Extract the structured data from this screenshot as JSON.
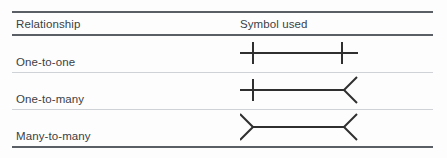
{
  "table": {
    "headers": {
      "relationship": "Relationship",
      "symbol": "Symbol used"
    },
    "rows": [
      {
        "label": "One-to-one",
        "symbol_name": "one-to-one-symbol",
        "left_end": "single-tick",
        "right_end": "single-tick"
      },
      {
        "label": "One-to-many",
        "symbol_name": "one-to-many-symbol",
        "left_end": "single-tick",
        "right_end": "crow-foot"
      },
      {
        "label": "Many-to-many",
        "symbol_name": "many-to-many-symbol",
        "left_end": "crow-foot",
        "right_end": "crow-foot"
      }
    ]
  },
  "colors": {
    "rule_strong": "#5a5f66",
    "rule_light": "#cfd2d6",
    "text": "#3b3f45",
    "symbol_stroke": "#2f2f2f",
    "background": "#fdfdfd"
  }
}
